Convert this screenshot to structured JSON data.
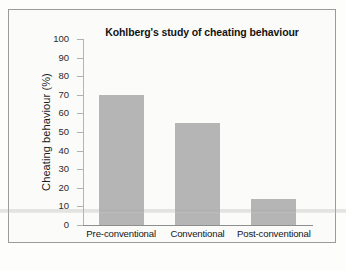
{
  "chart_data": {
    "type": "bar",
    "title": "Kohlberg's study of cheating behaviour",
    "xlabel": "",
    "ylabel": "Cheating behaviour (%)",
    "categories": [
      "Pre-conventional",
      "Conventional",
      "Post-conventional"
    ],
    "values": [
      70,
      55,
      14
    ],
    "ylim": [
      0,
      100
    ],
    "yticks": [
      "0",
      "10",
      "20",
      "30",
      "40",
      "50",
      "60",
      "70",
      "80",
      "90",
      "100"
    ],
    "grid": false,
    "legend": null,
    "bar_color": "#b5b5b5",
    "axis_color": "#9b9b9b",
    "background_color": "#fbfbf9",
    "frame_color": "#9b9b9b"
  }
}
